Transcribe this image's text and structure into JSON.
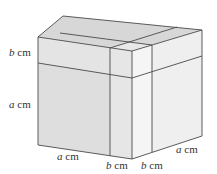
{
  "diagram": {
    "colors": {
      "top_face": "#d7d7d7",
      "top_strip": "#dcdcdc",
      "front_face": "#dedede",
      "front_upper": "#e3e3e3",
      "right_face": "#efefef",
      "right_upper": "#f3f3f3",
      "edge": "#4a4a4a",
      "text": "#333333"
    },
    "labels": {
      "left_b": {
        "var": "b",
        "unit": " cm"
      },
      "left_a": {
        "var": "a",
        "unit": " cm"
      },
      "bottom_a": {
        "var": "a",
        "unit": " cm"
      },
      "bottom_b_front": {
        "var": "b",
        "unit": " cm"
      },
      "bottom_b_right": {
        "var": "b",
        "unit": " cm"
      },
      "right_a": {
        "var": "a",
        "unit": " cm"
      }
    }
  }
}
